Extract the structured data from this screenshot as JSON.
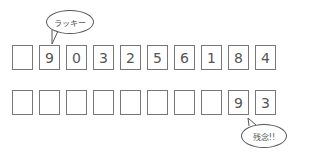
{
  "row1": {
    "digits": [
      "",
      "9",
      "0",
      "3",
      "2",
      "5",
      "6",
      "1",
      "8",
      "4"
    ]
  },
  "row2": {
    "digits": [
      "",
      "",
      "",
      "",
      "",
      "",
      "",
      "",
      "9",
      "3"
    ]
  },
  "bubbles": {
    "top": "ラッキー",
    "bottom": "残念!!"
  },
  "colors": {
    "border": "#777777",
    "text": "#555555"
  }
}
